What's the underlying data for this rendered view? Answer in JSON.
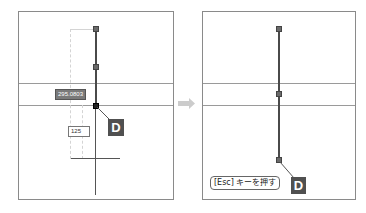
{
  "left_panel": {
    "dynamic_input_value": "295.0803",
    "length_input_value": "125",
    "badge_label": "D"
  },
  "arrow": {
    "icon": "right-arrow-icon",
    "color": "#cccccc"
  },
  "right_panel": {
    "instruction": "[Esc] キーを押す",
    "badge_label": "D"
  },
  "colors": {
    "panel_border": "#8a8a8a",
    "line": "#4a4a4a",
    "badge_bg": "#505050",
    "guide_line": "#9a9a9a"
  }
}
